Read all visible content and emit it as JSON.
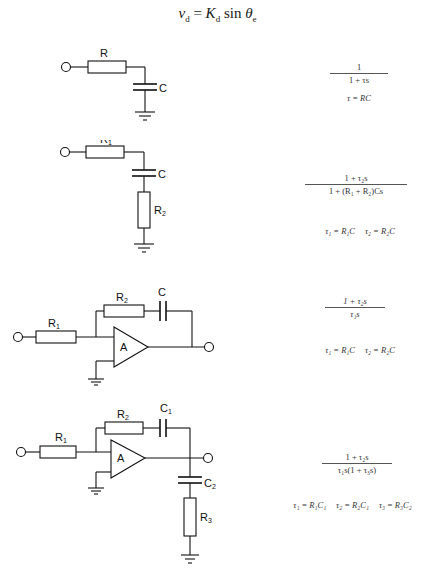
{
  "header": {
    "equation_lhs": "v",
    "equation_lhs_sub": "d",
    "equation_eq": " = ",
    "equation_K": "K",
    "equation_K_sub": "d",
    "equation_sin": " sin ",
    "equation_theta": "θ",
    "equation_theta_sub": "e"
  },
  "circuits": [
    {
      "id": "passive-lag",
      "labels": {
        "r": "R",
        "c": "C"
      },
      "transfer_function": {
        "numerator": "1",
        "denominator": "1 + τs"
      },
      "time_constants": [
        "τ = RC"
      ]
    },
    {
      "id": "passive-lag-lead",
      "labels": {
        "r1": "R",
        "r1_sub": "1",
        "c": "C",
        "r2": "R",
        "r2_sub": "2"
      },
      "transfer_function": {
        "numerator": "1 + τ₂s",
        "denominator": "1 + (R₁ + R₂)Cs"
      },
      "time_constants": [
        "τ₁ = R₁C",
        "τ₂ = R₂C"
      ]
    },
    {
      "id": "active-pi",
      "labels": {
        "r1": "R",
        "r1_sub": "1",
        "r2": "R",
        "r2_sub": "2",
        "c": "C",
        "amp": "A"
      },
      "transfer_function": {
        "numerator": "1 + τ₂s",
        "denominator": "τ₁s"
      },
      "time_constants": [
        "τ₁ = R₁C",
        "τ₂ = R₂C"
      ]
    },
    {
      "id": "active-pi-with-pole",
      "labels": {
        "r1": "R",
        "r1_sub": "1",
        "r2": "R",
        "r2_sub": "2",
        "c1": "C",
        "c1_sub": "1",
        "c2": "C",
        "c2_sub": "2",
        "r3": "R",
        "r3_sub": "3",
        "amp": "A"
      },
      "transfer_function": {
        "numerator": "1 + τ₂s",
        "denominator": "τ₁s(1 + τ₃s)"
      },
      "time_constants": [
        "τ₁ = R₁C₁",
        "τ₂ = R₂C₁",
        "τ₃ = R₃C₂"
      ]
    }
  ],
  "colors": {
    "ink": "#111111",
    "background": "#ffffff"
  }
}
